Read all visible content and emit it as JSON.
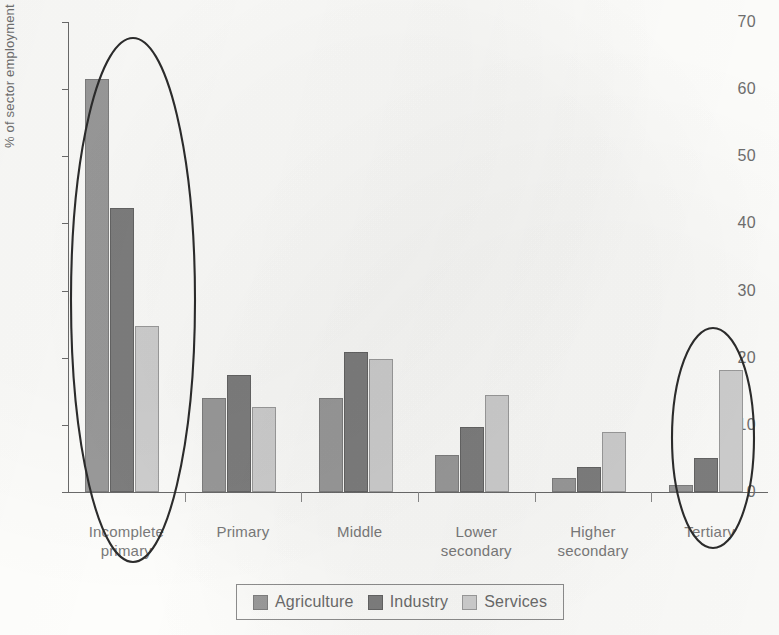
{
  "chart_data": {
    "type": "bar",
    "title": "",
    "xlabel": "",
    "ylabel": "% of sector employment",
    "ylim": [
      0,
      70
    ],
    "ytick_step": 10,
    "yticks": [
      0,
      10,
      20,
      30,
      40,
      50,
      60,
      70
    ],
    "ytick_labels": [
      "0",
      "10",
      "20",
      "30",
      "40",
      "50",
      "60",
      "70"
    ],
    "grid": false,
    "legend_position": "bottom",
    "categories": [
      "Incomplete primary",
      "Primary",
      "Middle",
      "Lower secondary",
      "Higher secondary",
      "Tertiary"
    ],
    "category_lines": [
      [
        "Incomplete",
        "primary"
      ],
      [
        "Primary"
      ],
      [
        "Middle"
      ],
      [
        "Lower",
        "secondary"
      ],
      [
        "Higher",
        "secondary"
      ],
      [
        "Tertiary"
      ]
    ],
    "series": [
      {
        "name": "Agriculture",
        "color": "#9a9a9a",
        "values": [
          61.5,
          14.0,
          14.0,
          5.5,
          2.1,
          1.0
        ]
      },
      {
        "name": "Industry",
        "color": "#7e7e7e",
        "values": [
          42.3,
          17.4,
          20.8,
          9.7,
          3.7,
          5.1
        ]
      },
      {
        "name": "Services",
        "color": "#cfcfcf",
        "values": [
          24.7,
          12.7,
          19.8,
          14.4,
          9.0,
          18.2
        ]
      }
    ],
    "annotations": [
      {
        "type": "ellipse",
        "label": "highlight-incomplete-primary",
        "targets": [
          "Incomplete primary"
        ]
      },
      {
        "type": "ellipse",
        "label": "highlight-tertiary",
        "targets": [
          "Tertiary"
        ]
      }
    ]
  },
  "legend": {
    "items": [
      {
        "label": "Agriculture",
        "key": "agriculture"
      },
      {
        "label": "Industry",
        "key": "industry"
      },
      {
        "label": "Services",
        "key": "services"
      }
    ]
  }
}
